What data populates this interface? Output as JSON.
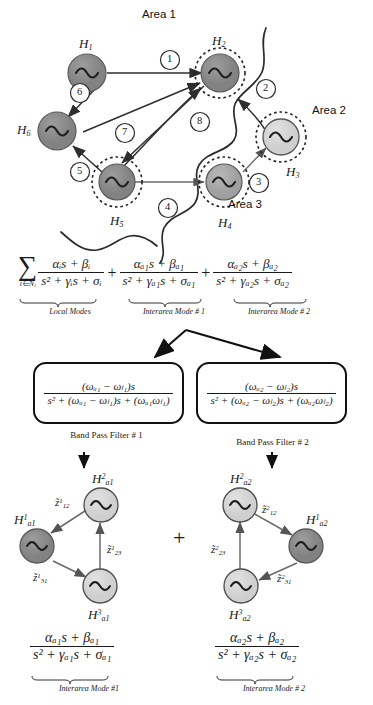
{
  "figure": {
    "type": "power-system-modal-decomposition-diagram",
    "areas": [
      {
        "name": "area-1",
        "label": "Area 1"
      },
      {
        "name": "area-2",
        "label": "Area 2"
      },
      {
        "name": "area-3",
        "label": "Area 3"
      }
    ],
    "generators": [
      {
        "id": "H1",
        "label_base": "H",
        "sub": "1",
        "fill": "#8c8c8c",
        "ring": false
      },
      {
        "id": "H2",
        "label_base": "H",
        "sub": "2",
        "fill": "#8c8c8c",
        "ring": true
      },
      {
        "id": "H3",
        "label_base": "H",
        "sub": "3",
        "fill": "#d5d5d5",
        "ring": true
      },
      {
        "id": "H4",
        "label_base": "H",
        "sub": "4",
        "fill": "#a8a8a8",
        "ring": true
      },
      {
        "id": "H5",
        "label_base": "H",
        "sub": "5",
        "fill": "#8c8c8c",
        "ring": true
      },
      {
        "id": "H6",
        "label_base": "H",
        "sub": "6",
        "fill": "#8c8c8c",
        "ring": false
      }
    ],
    "edge_numbers": [
      "1",
      "2",
      "3",
      "4",
      "5",
      "6",
      "7",
      "8"
    ]
  },
  "main_equation": {
    "sigma": "∑",
    "sigma_index": "i∈N",
    "sigma_index_sub": "l",
    "terms": [
      {
        "name": "local-modes",
        "numerator_alpha": "α",
        "numerator_alpha_sub": "i",
        "numerator_beta": "β",
        "numerator_beta_sub": "i",
        "numerator": "αᵢs + βᵢ",
        "denominator": "s² + γᵢs + σᵢ",
        "caption": "Local Modes"
      },
      {
        "name": "interarea-mode-1",
        "numerator": "αₐ₁s + βₐ₁",
        "denominator": "s² + γₐ₁s + σₐ₁",
        "caption": "Interarea Mode # 1"
      },
      {
        "name": "interarea-mode-2",
        "numerator": "αₐ₂s + βₐ₂",
        "denominator": "s² + γₐ₂s + σₐ₂",
        "caption": "Interarea Mode # 2"
      }
    ],
    "plus": "+"
  },
  "filters": [
    {
      "name": "band-pass-filter-1",
      "numerator": "(ωᵤ₁ − ωₗ₁)s",
      "denominator": "s² + (ωᵤ₁ − ωₗ₁)s + (ωᵤ₁ωₗ₁)",
      "caption": "Band Pass Filter # 1"
    },
    {
      "name": "band-pass-filter-2",
      "numerator": "(ωᵤ₂ − ωₗ₂)s",
      "denominator": "s² + (ωᵤ₂ − ωₗ₂)s + (ωᵤ₂ωₗ₂)",
      "caption": "Band Pass Filter # 2"
    }
  ],
  "equivalent_networks": [
    {
      "name": "equivalent-network-1",
      "nodes": [
        {
          "id": "H2a1",
          "base": "H",
          "sup": "2",
          "sub": "a1",
          "fill": "#d5d5d5"
        },
        {
          "id": "H1a1",
          "base": "H",
          "sup": "1",
          "sub": "a1",
          "fill": "#8c8c8c"
        },
        {
          "id": "H3a1",
          "base": "H",
          "sup": "3",
          "sub": "a1",
          "fill": "#d5d5d5"
        }
      ],
      "edges": [
        {
          "id": "z1_12",
          "base": "z̃",
          "sup": "1",
          "sub": "12"
        },
        {
          "id": "z1_23",
          "base": "z̃",
          "sup": "1",
          "sub": "23"
        },
        {
          "id": "z1_31",
          "base": "z̃",
          "sup": "1",
          "sub": "31"
        }
      ],
      "equation": {
        "numerator": "αₐ₁s + βₐ₁",
        "denominator": "s² + γₐ₁s + σₐ₁",
        "caption": "Interarea Mode #1"
      }
    },
    {
      "name": "equivalent-network-2",
      "nodes": [
        {
          "id": "H2a2",
          "base": "H",
          "sup": "2",
          "sub": "a2",
          "fill": "#d5d5d5"
        },
        {
          "id": "H1a2",
          "base": "H",
          "sup": "1",
          "sub": "a2",
          "fill": "#8c8c8c"
        },
        {
          "id": "H3a2",
          "base": "H",
          "sup": "3",
          "sub": "a2",
          "fill": "#d5d5d5"
        }
      ],
      "edges": [
        {
          "id": "z2_12",
          "base": "z̃",
          "sup": "2",
          "sub": "12"
        },
        {
          "id": "z2_23",
          "base": "z̃",
          "sup": "2",
          "sub": "23"
        },
        {
          "id": "z2_31",
          "base": "z̃",
          "sup": "2",
          "sub": "31"
        }
      ],
      "equation": {
        "numerator": "αₐ₂s + βₐ₂",
        "denominator": "s² + γₐ₂s + σₐ₂",
        "caption": "Interarea Mode # 2"
      }
    }
  ],
  "sum_symbol": "+",
  "colors": {
    "dark_node": "#8c8c8c",
    "mid_node": "#a8a8a8",
    "light_node": "#d5d5d5",
    "stroke": "#3a3a3a",
    "ink": "#1a1a1a"
  }
}
